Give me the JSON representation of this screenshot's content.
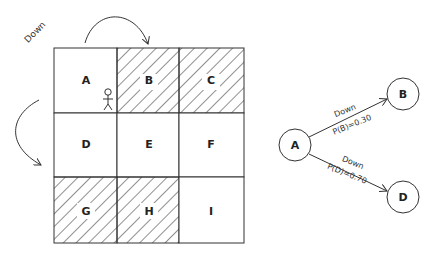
{
  "grid": {
    "cells": [
      {
        "label": "A",
        "hatched": false
      },
      {
        "label": "B",
        "hatched": true
      },
      {
        "label": "C",
        "hatched": true
      },
      {
        "label": "D",
        "hatched": false
      },
      {
        "label": "E",
        "hatched": false
      },
      {
        "label": "F",
        "hatched": false
      },
      {
        "label": "G",
        "hatched": true
      },
      {
        "label": "H",
        "hatched": true
      },
      {
        "label": "I",
        "hatched": false
      }
    ],
    "agent_cell": "A",
    "action_label": "Down"
  },
  "tree": {
    "root": "A",
    "nodes": [
      {
        "id": "A",
        "label": "A"
      },
      {
        "id": "B",
        "label": "B"
      },
      {
        "id": "D",
        "label": "D"
      }
    ],
    "edges": [
      {
        "from": "A",
        "to": "B",
        "action": "Down",
        "prob": "P(B)=0.30"
      },
      {
        "from": "A",
        "to": "D",
        "action": "Down",
        "prob": "P(D)=0.70"
      }
    ]
  }
}
